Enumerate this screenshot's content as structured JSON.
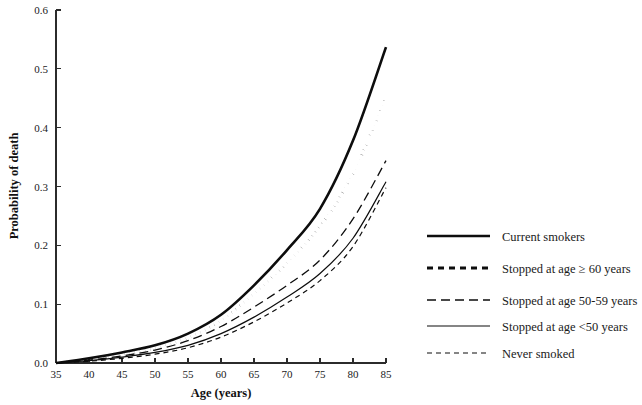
{
  "chart_data": {
    "type": "line",
    "title": "",
    "xlabel": "Age (years)",
    "ylabel": "Probability of death",
    "xlim": [
      35,
      85
    ],
    "ylim": [
      0.0,
      0.6
    ],
    "xticks": [
      35,
      40,
      45,
      50,
      55,
      60,
      65,
      70,
      75,
      80,
      85
    ],
    "xtick_labels": [
      "35",
      "40",
      "45",
      "50",
      "55",
      "60",
      "65",
      "70",
      "75",
      "80",
      "85"
    ],
    "yticks": [
      0.0,
      0.1,
      0.2,
      0.3,
      0.4,
      0.5,
      0.6
    ],
    "ytick_labels": [
      "0.0",
      "0.1",
      "0.2",
      "0.3",
      "0.4",
      "0.5",
      "0.6"
    ],
    "grid": false,
    "legend_position": "right",
    "x": [
      35,
      40,
      45,
      50,
      55,
      60,
      65,
      70,
      75,
      80,
      85
    ],
    "series": [
      {
        "name": "Current smokers",
        "style": "solid-thick",
        "color": "#0d0d0d",
        "values": [
          0.0,
          0.008,
          0.018,
          0.03,
          0.05,
          0.082,
          0.132,
          0.192,
          0.262,
          0.378,
          0.537
        ]
      },
      {
        "name": "Stopped at age ≥ 60 years",
        "style": "dotted-thick",
        "color": "#0d0d0d",
        "values": [
          0.0,
          0.006,
          0.014,
          0.025,
          0.043,
          0.072,
          0.118,
          0.17,
          0.232,
          0.322,
          0.452
        ]
      },
      {
        "name": "Stopped at age 50-59 years",
        "style": "dashed-long",
        "color": "#0d0d0d",
        "values": [
          0.0,
          0.005,
          0.012,
          0.022,
          0.038,
          0.062,
          0.095,
          0.132,
          0.175,
          0.245,
          0.344
        ]
      },
      {
        "name": "Stopped at age <50 years",
        "style": "solid-thin",
        "color": "#0d0d0d",
        "values": [
          0.0,
          0.004,
          0.01,
          0.018,
          0.03,
          0.05,
          0.078,
          0.112,
          0.152,
          0.212,
          0.308
        ]
      },
      {
        "name": "Never smoked",
        "style": "dashed-short",
        "color": "#0d0d0d",
        "values": [
          0.0,
          0.003,
          0.008,
          0.015,
          0.026,
          0.044,
          0.07,
          0.102,
          0.14,
          0.198,
          0.298
        ]
      }
    ]
  },
  "axes": {
    "x_title": "Age (years)",
    "y_title": "Probability of death"
  },
  "legend": {
    "items": [
      {
        "label": "Current smokers"
      },
      {
        "label": "Stopped at age ≥ 60 years"
      },
      {
        "label": "Stopped at age 50-59 years"
      },
      {
        "label": "Stopped at age <50 years"
      },
      {
        "label": "Never smoked"
      }
    ]
  }
}
